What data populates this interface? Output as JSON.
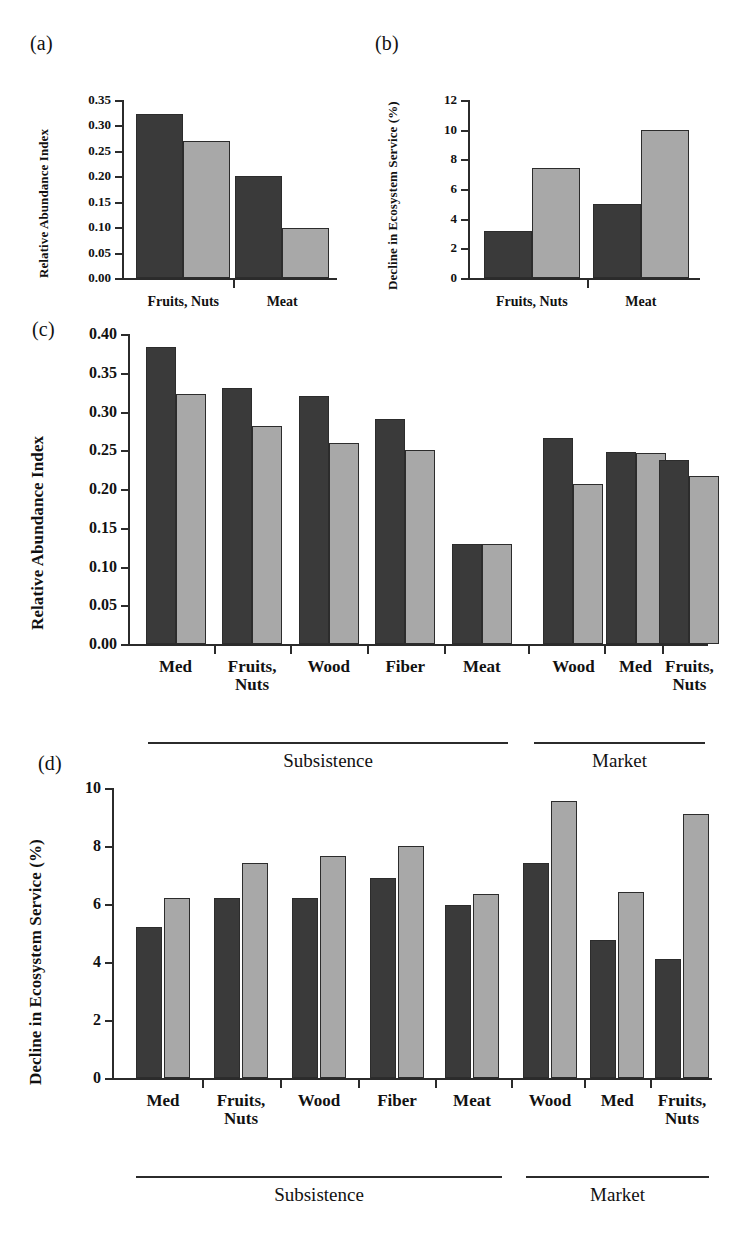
{
  "figure": {
    "background": "#ffffff",
    "series_colors": {
      "dark": "#3a3a3a",
      "light": "#a8a8a8"
    },
    "panel_labels": {
      "a": "(a)",
      "b": "(b)",
      "c": "(c)",
      "d": "(d)"
    }
  },
  "chart_data": [
    {
      "id": "a",
      "type": "bar",
      "title": "(a)",
      "xlabel": "",
      "ylabel": "Relative Abundance Index",
      "categories": [
        "Fruits, Nuts",
        "Meat"
      ],
      "ylim": [
        0,
        0.35
      ],
      "yticks": [
        "0.00",
        "0.05",
        "0.10",
        "0.15",
        "0.20",
        "0.25",
        "0.30",
        "0.35"
      ],
      "ytick_values": [
        0,
        0.05,
        0.1,
        0.15,
        0.2,
        0.25,
        0.3,
        0.35
      ],
      "grid": false,
      "legend": "none",
      "series": [
        {
          "name": "dark",
          "color": "#3a3a3a",
          "values": [
            0.322,
            0.2
          ]
        },
        {
          "name": "light",
          "color": "#a8a8a8",
          "values": [
            0.27,
            0.098
          ]
        }
      ]
    },
    {
      "id": "b",
      "type": "bar",
      "title": "(b)",
      "xlabel": "",
      "ylabel": "Decline in Ecosystem Service (%)",
      "categories": [
        "Fruits, Nuts",
        "Meat"
      ],
      "ylim": [
        0,
        12
      ],
      "yticks": [
        "0",
        "2",
        "4",
        "6",
        "8",
        "10",
        "12"
      ],
      "ytick_values": [
        0,
        2,
        4,
        6,
        8,
        10,
        12
      ],
      "grid": false,
      "legend": "none",
      "series": [
        {
          "name": "dark",
          "color": "#3a3a3a",
          "values": [
            3.15,
            5.0
          ]
        },
        {
          "name": "light",
          "color": "#a8a8a8",
          "values": [
            7.4,
            10.0
          ]
        }
      ]
    },
    {
      "id": "c",
      "type": "bar",
      "title": "(c)",
      "xlabel": "",
      "ylabel": "Relative Abundance Index",
      "categories": [
        "Med",
        "Fruits,\nNuts",
        "Wood",
        "Fiber",
        "Meat",
        "Wood",
        "Med",
        "Fruits,\nNuts"
      ],
      "groups": [
        {
          "label": "Subsistence",
          "start": 0,
          "end": 4
        },
        {
          "label": "Market",
          "start": 5,
          "end": 7
        }
      ],
      "ylim": [
        0,
        0.4
      ],
      "yticks": [
        "0.00",
        "0.05",
        "0.10",
        "0.15",
        "0.20",
        "0.25",
        "0.30",
        "0.35",
        "0.40"
      ],
      "ytick_values": [
        0,
        0.05,
        0.1,
        0.15,
        0.2,
        0.25,
        0.3,
        0.35,
        0.4
      ],
      "grid": false,
      "legend": "none",
      "series": [
        {
          "name": "dark",
          "color": "#3a3a3a",
          "values": [
            0.383,
            0.33,
            0.32,
            0.29,
            0.129,
            0.266,
            0.248,
            0.237
          ]
        },
        {
          "name": "light",
          "color": "#a8a8a8",
          "values": [
            0.322,
            0.281,
            0.26,
            0.25,
            0.129,
            0.207,
            0.247,
            0.217
          ]
        }
      ]
    },
    {
      "id": "d",
      "type": "bar",
      "title": "(d)",
      "xlabel": "",
      "ylabel": "Decline in Ecosystem Service (%)",
      "categories": [
        "Med",
        "Fruits,\nNuts",
        "Wood",
        "Fiber",
        "Meat",
        "Wood",
        "Med",
        "Fruits,\nNuts"
      ],
      "groups": [
        {
          "label": "Subsistence",
          "start": 0,
          "end": 4
        },
        {
          "label": "Market",
          "start": 5,
          "end": 7
        }
      ],
      "ylim": [
        0,
        10
      ],
      "yticks": [
        "0",
        "2",
        "4",
        "6",
        "8",
        "10"
      ],
      "ytick_values": [
        0,
        2,
        4,
        6,
        8,
        10
      ],
      "grid": false,
      "legend": "none",
      "series": [
        {
          "name": "dark",
          "color": "#3a3a3a",
          "values": [
            5.2,
            6.2,
            6.2,
            6.9,
            5.95,
            7.4,
            4.75,
            4.1
          ]
        },
        {
          "name": "light",
          "color": "#a8a8a8",
          "values": [
            6.2,
            7.4,
            7.65,
            8.0,
            6.35,
            9.55,
            6.4,
            9.1
          ]
        }
      ]
    }
  ]
}
